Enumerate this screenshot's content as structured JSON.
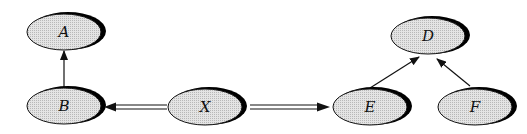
{
  "diagram": {
    "nodes": [
      {
        "id": "A",
        "label": "A",
        "cx": 64,
        "cy": 32
      },
      {
        "id": "B",
        "label": "B",
        "cx": 64,
        "cy": 106
      },
      {
        "id": "X",
        "label": "X",
        "cx": 205,
        "cy": 107
      },
      {
        "id": "E",
        "label": "E",
        "cx": 370,
        "cy": 107
      },
      {
        "id": "F",
        "label": "F",
        "cx": 475,
        "cy": 107
      },
      {
        "id": "D",
        "label": "D",
        "cx": 400,
        "cy": 35
      }
    ],
    "edges": [
      {
        "from": "B",
        "to": "A",
        "style": "single"
      },
      {
        "from": "X",
        "to": "B",
        "style": "double"
      },
      {
        "from": "X",
        "to": "E",
        "style": "double"
      },
      {
        "from": "E",
        "to": "D",
        "style": "single"
      },
      {
        "from": "F",
        "to": "D",
        "style": "single"
      }
    ],
    "colors": {
      "node_fill": "#d8d8d8",
      "shadow": "#000000",
      "stroke": "#111111"
    }
  }
}
